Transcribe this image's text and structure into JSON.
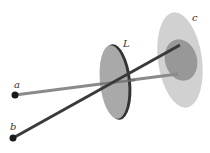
{
  "diagram": {
    "labels": {
      "a": "a",
      "b": "b",
      "lens": "L",
      "screen": "c"
    },
    "colors": {
      "ray_a": "#8a8a8a",
      "ray_b": "#3a3a3a",
      "lens": "#a8a8a8",
      "lens_rim": "#333333",
      "screen": "#c8c8c8",
      "screen_inner": "#8f8f8f",
      "point": "#1a1a1a"
    }
  }
}
